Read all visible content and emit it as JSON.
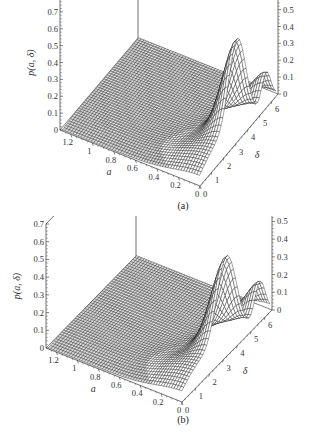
{
  "chart_data": [
    {
      "type": "surface3d",
      "caption": "(a)",
      "zlabel": "p(a, δ)",
      "xlabel": "a",
      "ylabel": "δ",
      "z_ticks": [
        "0",
        "0.1",
        "0.2",
        "0.3",
        "0.4",
        "0.5",
        "0.6",
        "0.7",
        "0.8"
      ],
      "a_ticks": [
        "0",
        "0.2",
        "0.4",
        "0.6",
        "0.8",
        "1",
        "1.2"
      ],
      "delta_ticks": [
        "0",
        "1",
        "2",
        "3",
        "4",
        "5",
        "6"
      ],
      "zlim": [
        0,
        0.8
      ],
      "alim": [
        0,
        1.3
      ],
      "deltalim": [
        0,
        6.5
      ],
      "peak": {
        "a": 0.05,
        "delta": 3.2,
        "value": 0.59
      },
      "secondary_peak": {
        "a": 0.05,
        "delta": 5.6,
        "value": 0.2
      },
      "description": "Mesh surface, near-zero plateau for a > 0.3, main peak near a≈0 at δ≈3.2"
    },
    {
      "type": "surface3d",
      "caption": "(b)",
      "zlabel": "p(a, δ)",
      "xlabel": "a",
      "ylabel": "δ",
      "z_ticks": [
        "0",
        "0.1",
        "0.2",
        "0.3",
        "0.4",
        "0.5",
        "0.6",
        "0.7"
      ],
      "a_ticks": [
        "0",
        "0.2",
        "0.4",
        "0.6",
        "0.8",
        "1",
        "1.2"
      ],
      "delta_ticks": [
        "0",
        "1",
        "2",
        "3",
        "4",
        "5",
        "6"
      ],
      "zlim": [
        0,
        0.7
      ],
      "alim": [
        0,
        1.3
      ],
      "deltalim": [
        0,
        6.5
      ],
      "peak": {
        "a": 0.05,
        "delta": 3.3,
        "value": 0.55
      },
      "secondary_peak": {
        "a": 0.05,
        "delta": 5.7,
        "value": 0.22
      },
      "description": "Mesh surface, near-zero plateau for a > 0.3, main peak near a≈0 at δ≈3.3"
    }
  ],
  "figure": {
    "caption_a": "(a)",
    "caption_b": "(b)",
    "axis_a_label": "a",
    "axis_delta_label": "δ",
    "z_label": "p(a, δ)"
  }
}
